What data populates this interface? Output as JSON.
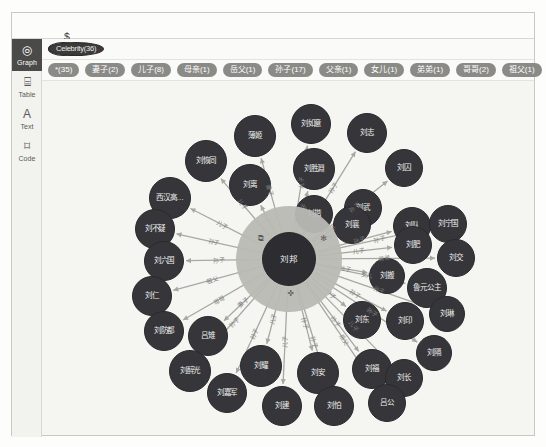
{
  "query": {
    "prompt": "$",
    "text": "MATCH (n:Celebrity {name:'刘邦'}) RETURN n"
  },
  "rail": {
    "items": [
      {
        "name": "graph",
        "label": "Graph",
        "icon": "graph-icon",
        "active": true
      },
      {
        "name": "table",
        "label": "Table",
        "icon": "table-icon",
        "active": false
      },
      {
        "name": "text",
        "label": "Text",
        "icon": "text-icon",
        "active": false
      },
      {
        "name": "code",
        "label": "Code",
        "icon": "code-icon",
        "active": false
      }
    ]
  },
  "node_labels": [
    {
      "label": "*(36)",
      "selected": false
    },
    {
      "label": "Celebrity(36)",
      "selected": true
    }
  ],
  "rel_types": [
    {
      "label": "*(35)"
    },
    {
      "label": "妻子(2)"
    },
    {
      "label": "儿子(8)"
    },
    {
      "label": "母亲(1)"
    },
    {
      "label": "岳父(1)"
    },
    {
      "label": "孙子(17)"
    },
    {
      "label": "父亲(1)"
    },
    {
      "label": "女儿(1)"
    },
    {
      "label": "弟弟(1)"
    },
    {
      "label": "哥哥(2)"
    },
    {
      "label": "祖父(1)"
    }
  ],
  "colors": {
    "node_fill": "#35353a",
    "center_fill": "#2c2c31",
    "halo": "#b9b9b4",
    "canvas": "#f5f5f2",
    "chip_node": "#9a9a96",
    "chip_node_selected": "#3b3b39",
    "chip_rel": "#8a8a86",
    "edge": "#a8a8a3"
  },
  "graph": {
    "center": {
      "name": "刘邦",
      "x": 247,
      "y": 178,
      "r": 27
    },
    "halo": {
      "x": 247,
      "y": 178,
      "r": 53
    },
    "halo_icons": [
      {
        "name": "expand-icon",
        "glyph": "⧉",
        "x": 213,
        "y": 152
      },
      {
        "name": "info-icon",
        "glyph": "✻",
        "x": 276,
        "y": 152
      },
      {
        "name": "unlock-icon",
        "glyph": "✜",
        "x": 243,
        "y": 207
      }
    ],
    "nodes": [
      {
        "name": "刘如意",
        "x": 269,
        "y": 43,
        "r": 20,
        "rel": "儿子"
      },
      {
        "name": "刘志",
        "x": 325,
        "y": 52,
        "r": 20,
        "rel": "孙子"
      },
      {
        "name": "薄姬",
        "x": 213,
        "y": 55,
        "r": 21,
        "rel": "妻子"
      },
      {
        "name": "刘胜淵",
        "x": 272,
        "y": 88,
        "r": 21,
        "rel": "孙子"
      },
      {
        "name": "刘恢同",
        "x": 164,
        "y": 80,
        "r": 21,
        "rel": "儿子"
      },
      {
        "name": "刘囚",
        "x": 362,
        "y": 87,
        "r": 19,
        "rel": "孙子"
      },
      {
        "name": "刘离",
        "x": 208,
        "y": 104,
        "r": 21,
        "rel": "儿子"
      },
      {
        "name": "刘揩",
        "x": 272,
        "y": 133,
        "r": 19,
        "rel": "孙子"
      },
      {
        "name": "刘武",
        "x": 321,
        "y": 127,
        "r": 19,
        "rel": "孙子"
      },
      {
        "name": "西汉高…",
        "x": 128,
        "y": 117,
        "r": 21,
        "rel": "儿子"
      },
      {
        "name": "刘襄",
        "x": 310,
        "y": 144,
        "r": 19,
        "rel": "孙子"
      },
      {
        "name": "刘队",
        "x": 370,
        "y": 145,
        "r": 19,
        "rel": "孙子"
      },
      {
        "name": "刘宁国",
        "x": 406,
        "y": 143,
        "r": 19,
        "rel": "孙子"
      },
      {
        "name": "刘不疑",
        "x": 113,
        "y": 148,
        "r": 20,
        "rel": "孙子"
      },
      {
        "name": "刘肥",
        "x": 371,
        "y": 164,
        "r": 19,
        "rel": "儿子"
      },
      {
        "name": "刘交",
        "x": 414,
        "y": 177,
        "r": 19,
        "rel": "弟弟"
      },
      {
        "name": "刘六国",
        "x": 122,
        "y": 180,
        "r": 20,
        "rel": "孙子"
      },
      {
        "name": "刘搬",
        "x": 345,
        "y": 195,
        "r": 18,
        "rel": "孙子"
      },
      {
        "name": "鲁元公主",
        "x": 385,
        "y": 207,
        "r": 20,
        "rel": "女儿"
      },
      {
        "name": "刘仁",
        "x": 110,
        "y": 215,
        "r": 20,
        "rel": "祖父"
      },
      {
        "name": "刘东",
        "x": 320,
        "y": 239,
        "r": 19,
        "rel": "孙子"
      },
      {
        "name": "刘印",
        "x": 363,
        "y": 240,
        "r": 19,
        "rel": "孙子"
      },
      {
        "name": "刘琳",
        "x": 405,
        "y": 233,
        "r": 18,
        "rel": "孙子"
      },
      {
        "name": "刘防都",
        "x": 122,
        "y": 250,
        "r": 20,
        "rel": "哥哥"
      },
      {
        "name": "刘隔",
        "x": 392,
        "y": 272,
        "r": 18,
        "rel": "孙子"
      },
      {
        "name": "吕雉",
        "x": 166,
        "y": 255,
        "r": 20,
        "rel": "妻子"
      },
      {
        "name": "刘醉光",
        "x": 148,
        "y": 290,
        "r": 21,
        "rel": "孙子"
      },
      {
        "name": "刘耀",
        "x": 219,
        "y": 285,
        "r": 21,
        "rel": "儿子"
      },
      {
        "name": "刘安",
        "x": 276,
        "y": 292,
        "r": 21,
        "rel": "孙子"
      },
      {
        "name": "刘福",
        "x": 330,
        "y": 288,
        "r": 20,
        "rel": "孙子"
      },
      {
        "name": "刘长",
        "x": 362,
        "y": 297,
        "r": 19,
        "rel": "儿子"
      },
      {
        "name": "刘嘉军",
        "x": 185,
        "y": 312,
        "r": 20,
        "rel": "孙子"
      },
      {
        "name": "刘建",
        "x": 240,
        "y": 325,
        "r": 20,
        "rel": "儿子"
      },
      {
        "name": "刘怕",
        "x": 292,
        "y": 325,
        "r": 20,
        "rel": "孙子"
      },
      {
        "name": "吕公",
        "x": 345,
        "y": 322,
        "r": 19,
        "rel": "岳父"
      }
    ]
  }
}
